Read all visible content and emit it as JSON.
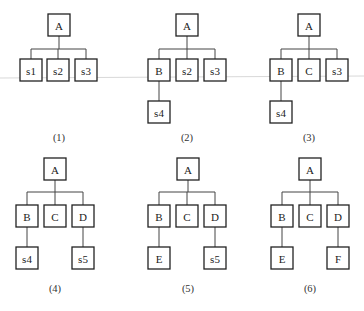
{
  "figure": {
    "panels": [
      {
        "caption": "(1)",
        "root": "A",
        "children": [
          "s1",
          "s2",
          "s3"
        ],
        "grandchildren": [
          null,
          null,
          null
        ]
      },
      {
        "caption": "(2)",
        "root": "A",
        "children": [
          "B",
          "s2",
          "s3"
        ],
        "grandchildren": [
          "s4",
          null,
          null
        ]
      },
      {
        "caption": "(3)",
        "root": "A",
        "children": [
          "B",
          "C",
          "s3"
        ],
        "grandchildren": [
          "s4",
          null,
          null
        ]
      },
      {
        "caption": "(4)",
        "root": "A",
        "children": [
          "B",
          "C",
          "D"
        ],
        "grandchildren": [
          "s4",
          null,
          "s5"
        ]
      },
      {
        "caption": "(5)",
        "root": "A",
        "children": [
          "B",
          "C",
          "D"
        ],
        "grandchildren": [
          "E",
          null,
          "s5"
        ]
      },
      {
        "caption": "(6)",
        "root": "A",
        "children": [
          "B",
          "C",
          "D"
        ],
        "grandchildren": [
          "E",
          null,
          "F"
        ]
      }
    ]
  }
}
